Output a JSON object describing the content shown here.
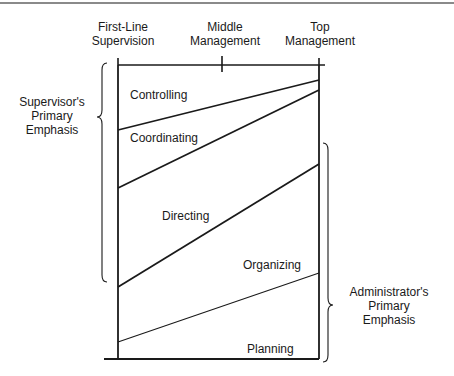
{
  "axis": {
    "levels": [
      {
        "line1": "First-Line",
        "line2": "Supervision"
      },
      {
        "line1": "Middle",
        "line2": "Management"
      },
      {
        "line1": "Top",
        "line2": "Management"
      }
    ]
  },
  "functions": [
    {
      "label": "Controlling"
    },
    {
      "label": "Coordinating"
    },
    {
      "label": "Directing"
    },
    {
      "label": "Organizing"
    },
    {
      "label": "Planning"
    }
  ],
  "braces": {
    "supervisor": {
      "line1": "Supervisor's",
      "line2": "Primary",
      "line3": "Emphasis"
    },
    "administrator": {
      "line1": "Administrator's",
      "line2": "Primary",
      "line3": "Emphasis"
    }
  },
  "colors": {
    "line": "#1a1a1a",
    "background": "#ffffff",
    "top_rule": "#8a8a8a"
  }
}
